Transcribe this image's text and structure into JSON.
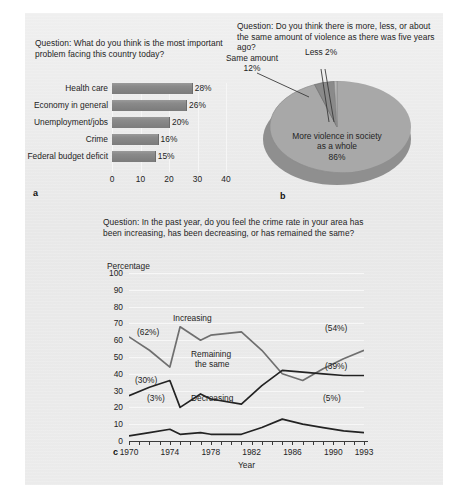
{
  "figure": {
    "background": "#ececec",
    "panels": [
      "a",
      "b",
      "c"
    ]
  },
  "panel_a": {
    "letter": "a",
    "question": "Question: What do you think is the most important problem facing this country today?",
    "chart_data": {
      "type": "bar",
      "orientation": "horizontal",
      "title": "Question: What do you think is the most important problem facing this country today?",
      "categories": [
        "Health care",
        "Economy in general",
        "Unemployment/jobs",
        "Crime",
        "Federal budget deficit"
      ],
      "values": [
        28,
        26,
        20,
        16,
        15
      ],
      "value_labels": [
        "28%",
        "26%",
        "20%",
        "16%",
        "15%"
      ],
      "xlabel": "",
      "ylabel": "",
      "xlim": [
        0,
        40
      ],
      "xticks": [
        0,
        10,
        20,
        30,
        40
      ],
      "xtick_labels": [
        "0",
        "10",
        "20",
        "30",
        "40"
      ],
      "grid": true,
      "bar_color": "#858585"
    }
  },
  "panel_b": {
    "letter": "b",
    "question": "Question: Do you think there is more, less, or about the same amount of violence as there was five years ago?",
    "chart_data": {
      "type": "pie",
      "title": "Question: Do you think there is more, less, or about the same amount of violence as there was five years ago?",
      "labels": [
        "More violence in society as a whole",
        "Same amount",
        "Less"
      ],
      "values": [
        86,
        12,
        2
      ],
      "value_labels": [
        "86%",
        "12%",
        "2%"
      ],
      "slice_label_main": "More violence in society",
      "slice_label_main_line2": "as a whole",
      "slice_label_main_pct": "86%",
      "slice_label_same": "Same amount",
      "slice_label_same_pct": "12%",
      "slice_label_less": "Less 2%",
      "colors": [
        "#a5a5a5",
        "#8b8b8b",
        "#b4b4b4"
      ],
      "legend": "none",
      "style": "3d"
    }
  },
  "panel_c": {
    "letter": "c",
    "question": "Question: In the past year, do you feel the crime rate in your area has been increasing, has been decreasing, or has remained the same?",
    "y_axis_title": "Percentage",
    "chart_data": {
      "type": "line",
      "title": "Question: In the past year, do you feel the crime rate in your area has been increasing, has been decreasing, or has remained the same?",
      "xlabel": "Year",
      "ylabel": "Percentage",
      "ylim": [
        0,
        100
      ],
      "yticks": [
        0,
        10,
        20,
        30,
        40,
        50,
        60,
        70,
        80,
        90,
        100
      ],
      "ytick_labels": [
        "0",
        "10",
        "20",
        "30",
        "40",
        "50",
        "60",
        "70",
        "80",
        "90",
        "100"
      ],
      "xlim": [
        1970,
        1993
      ],
      "xticks": [
        1970,
        1971,
        1972,
        1973,
        1974,
        1975,
        1976,
        1977,
        1978,
        1979,
        1980,
        1981,
        1982,
        1983,
        1984,
        1985,
        1986,
        1987,
        1988,
        1989,
        1990,
        1991,
        1992,
        1993
      ],
      "xtick_labels_shown": [
        "1970",
        "1974",
        "1978",
        "1982",
        "1986",
        "1990",
        "1993"
      ],
      "grid": true,
      "series": [
        {
          "name": "Increasing",
          "color": "#6f6f6f",
          "start_label": "(62%)",
          "end_label": "(54%)",
          "x": [
            1970,
            1972,
            1974,
            1975,
            1977,
            1978,
            1981,
            1983,
            1985,
            1987,
            1989,
            1991,
            1993
          ],
          "values": [
            62,
            54,
            44,
            68,
            60,
            63,
            65,
            54,
            40,
            36,
            43,
            49,
            54
          ]
        },
        {
          "name": "Remaining the same",
          "color": "#232323",
          "start_label": "(30%)",
          "end_label": "(39%)",
          "x": [
            1970,
            1972,
            1974,
            1975,
            1977,
            1978,
            1981,
            1983,
            1985,
            1987,
            1989,
            1991,
            1993
          ],
          "values": [
            27,
            32,
            36,
            20,
            28,
            25,
            22,
            33,
            42,
            41,
            40,
            39,
            39
          ]
        },
        {
          "name": "Decreasing",
          "color": "#232323",
          "start_label": "(3%)",
          "end_label": "(5%)",
          "x": [
            1970,
            1972,
            1974,
            1975,
            1977,
            1978,
            1981,
            1983,
            1985,
            1987,
            1989,
            1991,
            1993
          ],
          "values": [
            3,
            5,
            7,
            4,
            5,
            4,
            4,
            8,
            13,
            10,
            8,
            6,
            5
          ]
        }
      ]
    }
  }
}
